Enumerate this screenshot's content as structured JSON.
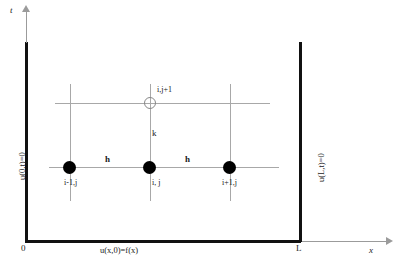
{
  "diagram": {
    "axes": {
      "t_label": "t",
      "x_label": "x",
      "origin_label": "0",
      "length_label": "L"
    },
    "boundary_conditions": {
      "left": "u(0,t)=0",
      "right": "u(L,t)=0",
      "initial": "u(x,0)=f(x)"
    },
    "nodes": [
      {
        "id": "i-1,j",
        "label": "i-1,j",
        "type": "filled"
      },
      {
        "id": "i,j",
        "label": "i, j",
        "type": "filled"
      },
      {
        "id": "i+1,j",
        "label": "i+1,j",
        "type": "filled"
      },
      {
        "id": "i,j+1",
        "label": "i,j+1",
        "type": "open"
      }
    ],
    "spacings": {
      "h_left": "h",
      "h_right": "h",
      "k": "k"
    },
    "colors": {
      "axis": "#111111",
      "grid": "#a8a8a8",
      "node_fill": "#000000",
      "node_open_stroke": "#888888",
      "text": "#1a1a1a",
      "background": "#ffffff"
    }
  }
}
